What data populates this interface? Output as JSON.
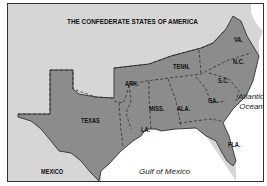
{
  "map": {
    "title": "THE CONFEDERATE STATES OF AMERICA",
    "colors": {
      "confederate_fill": "#8c8c8c",
      "other_land_fill": "#d6d6d6",
      "water_fill": "#ffffff",
      "border": "#222222"
    },
    "states": [
      {
        "abbr": "VA.",
        "name": "Virginia"
      },
      {
        "abbr": "N.C.",
        "name": "North Carolina"
      },
      {
        "abbr": "S.C.",
        "name": "South Carolina"
      },
      {
        "abbr": "TENN.",
        "name": "Tennessee"
      },
      {
        "abbr": "ARK.",
        "name": "Arkansas"
      },
      {
        "abbr": "MISS.",
        "name": "Mississippi"
      },
      {
        "abbr": "ALA.",
        "name": "Alabama"
      },
      {
        "abbr": "GA.",
        "name": "Georgia"
      },
      {
        "abbr": "LA.",
        "name": "Louisiana"
      },
      {
        "abbr": "FLA.",
        "name": "Florida"
      },
      {
        "abbr": "TEXAS",
        "name": "Texas"
      }
    ],
    "other_regions": [
      {
        "label": "MEXICO"
      }
    ],
    "water_bodies": [
      {
        "line1": "Atlantic",
        "line2": "Ocean"
      },
      {
        "line1": "Gulf of Mexico"
      }
    ]
  }
}
